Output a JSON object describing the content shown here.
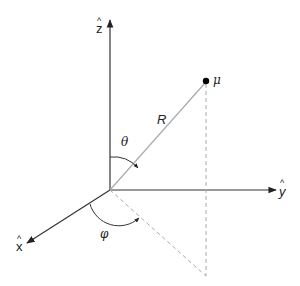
{
  "diagram": {
    "type": "spherical-coordinates",
    "axes": {
      "z": {
        "label": "z",
        "hat": "^"
      },
      "y": {
        "label": "y",
        "hat": "^"
      },
      "x": {
        "label": "x",
        "hat": "^"
      }
    },
    "point_label": "μ",
    "radius_label": "R",
    "polar_angle_label": "θ",
    "azimuth_angle_label": "φ",
    "colors": {
      "axis": "#333333",
      "radius": "#aaaaaa",
      "dashed": "#aaaaaa",
      "point": "#000000"
    }
  }
}
